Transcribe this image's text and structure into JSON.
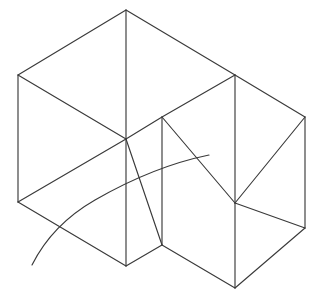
{
  "canvas": {
    "width": 322,
    "height": 301,
    "background_color": "#ffffff",
    "stroke_color": "#3a3a3a",
    "stroke_width": 1.15,
    "title": "Isometric wireframe of a stepped box solid with a sweeping arc"
  },
  "figure": {
    "type": "line-drawing",
    "style": "isometric-wireframe",
    "vertex_labels": [
      "top-apex",
      "left-upper",
      "left-lower",
      "center-hub",
      "center-bottom",
      "inner-top",
      "inner-bottom",
      "right-upper-top",
      "right-hub",
      "right-far-top",
      "right-far-bottom",
      "bottom-apex"
    ],
    "vertices": {
      "top-apex": [
        126,
        10
      ],
      "left-upper": [
        18,
        75
      ],
      "left-lower": [
        18,
        202
      ],
      "center-hub": [
        126,
        139
      ],
      "center-bottom": [
        126,
        266
      ],
      "inner-top": [
        162,
        117
      ],
      "inner-bottom": [
        162,
        245
      ],
      "right-upper-top": [
        235,
        75
      ],
      "right-hub": [
        235,
        203
      ],
      "right-far-top": [
        305,
        117
      ],
      "right-far-bottom": [
        305,
        228
      ],
      "bottom-apex": [
        235,
        288
      ]
    },
    "edges": [
      {
        "name": "top-left-roof",
        "from": "top-apex",
        "to": "left-upper"
      },
      {
        "name": "top-right-roof",
        "from": "top-apex",
        "to": "right-upper-top"
      },
      {
        "name": "center-vertical-upper",
        "from": "top-apex",
        "to": "center-hub"
      },
      {
        "name": "left-vertical",
        "from": "left-upper",
        "to": "left-lower"
      },
      {
        "name": "left-upper-to-hub",
        "from": "left-upper",
        "to": "center-hub"
      },
      {
        "name": "left-lower-to-hub",
        "from": "left-lower",
        "to": "center-hub"
      },
      {
        "name": "left-lower-to-center-bottom",
        "from": "left-lower",
        "to": "center-bottom"
      },
      {
        "name": "center-vertical-lower",
        "from": "center-hub",
        "to": "center-bottom"
      },
      {
        "name": "hub-to-inner-top",
        "from": "center-hub",
        "to": "inner-top"
      },
      {
        "name": "hub-to-inner-bottom",
        "from": "center-hub",
        "to": "inner-bottom"
      },
      {
        "name": "inner-vertical",
        "from": "inner-top",
        "to": "inner-bottom"
      },
      {
        "name": "inner-top-to-right-upper",
        "from": "inner-top",
        "to": "right-upper-top"
      },
      {
        "name": "inner-top-to-right-hub",
        "from": "inner-top",
        "to": "right-hub"
      },
      {
        "name": "right-upper-vertical",
        "from": "right-upper-top",
        "to": "right-hub"
      },
      {
        "name": "right-upper-to-far-top",
        "from": "right-upper-top",
        "to": "right-far-top"
      },
      {
        "name": "right-far-vertical",
        "from": "right-far-top",
        "to": "right-far-bottom"
      },
      {
        "name": "right-hub-to-far-top",
        "from": "right-hub",
        "to": "right-far-top"
      },
      {
        "name": "right-hub-to-far-bottom",
        "from": "right-hub",
        "to": "right-far-bottom"
      },
      {
        "name": "right-hub-vertical-lower",
        "from": "right-hub",
        "to": "bottom-apex"
      },
      {
        "name": "inner-bottom-to-bottom-apex",
        "from": "inner-bottom",
        "to": "bottom-apex"
      },
      {
        "name": "center-bottom-to-inner-bottom",
        "from": "center-bottom",
        "to": "inner-bottom"
      },
      {
        "name": "far-bottom-to-bottom-apex",
        "from": "right-far-bottom",
        "to": "bottom-apex"
      }
    ],
    "arc": {
      "name": "sweeping-curve",
      "start": [
        32,
        265
      ],
      "end": [
        209,
        155
      ],
      "waypoints": [
        [
          48,
          236
        ],
        [
          66,
          214
        ],
        [
          95,
          192
        ],
        [
          126,
          175
        ],
        [
          162,
          161
        ],
        [
          186,
          156
        ]
      ],
      "path": "M 32 265 C 44 241 62 219 95 200 C 128 181 170 163 209 155"
    }
  }
}
